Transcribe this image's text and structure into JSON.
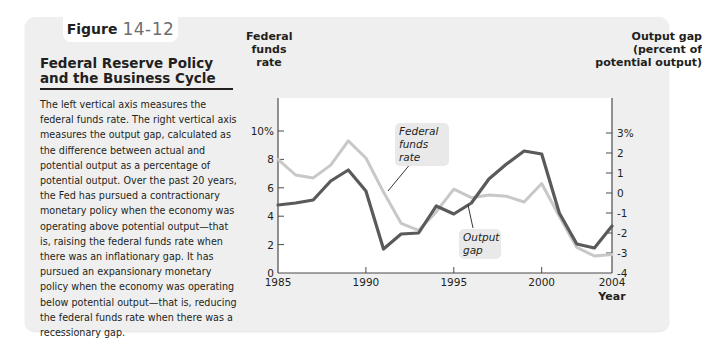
{
  "figure": {
    "label_word": "Figure",
    "label_number": "14-12"
  },
  "sidebar": {
    "title": "Federal Reserve Policy and the Business Cycle",
    "caption": "The left vertical axis measures the federal funds rate. The right vertical axis measures the output gap, calculated as the difference between actual and potential output as a percentage of potential output. Over the past 20 years, the Fed has pursued a contractionary monetary policy when the economy was operating above potential output—that is, raising the federal funds rate when there was an inflationary gap. It has pursued an expansionary monetary policy when the economy was operating below potential output—that is, reducing the federal funds rate when there was a recessionary gap."
  },
  "chart_data": {
    "type": "line",
    "title": "Federal Reserve Policy and the Business Cycle",
    "xlabel": "Year",
    "ylabel_left": "Federal funds rate",
    "ylabel_right": "Output gap (percent of potential output)",
    "x": [
      1985,
      1986,
      1987,
      1988,
      1989,
      1990,
      1991,
      1992,
      1993,
      1994,
      1995,
      1996,
      1997,
      1998,
      1999,
      2000,
      2001,
      2002,
      2003,
      2004
    ],
    "x_ticks": [
      "1985",
      "1990",
      "1995",
      "2000",
      "2004"
    ],
    "y_left_ticks": [
      "0",
      "2",
      "4",
      "6",
      "8",
      "10%"
    ],
    "y_right_ticks": [
      "-4",
      "-3",
      "-2",
      "-1",
      "0",
      "1",
      "2",
      "3%"
    ],
    "ylim_left": [
      0,
      12
    ],
    "ylim_right": [
      -4,
      4
    ],
    "grid": false,
    "series": [
      {
        "name": "Federal funds rate",
        "axis": "left",
        "color": "#c8c8c8",
        "values": [
          8.0,
          6.9,
          6.7,
          7.6,
          9.3,
          8.1,
          5.7,
          3.5,
          3.0,
          4.3,
          5.9,
          5.3,
          5.5,
          5.4,
          5.0,
          6.3,
          4.0,
          1.8,
          1.2,
          1.3
        ]
      },
      {
        "name": "Output gap",
        "axis": "right",
        "color": "#5a5a5c",
        "values": [
          -0.6,
          -0.5,
          -0.35,
          0.6,
          1.15,
          0.1,
          -2.8,
          -2.05,
          -2.0,
          -0.65,
          -1.05,
          -0.5,
          0.7,
          1.45,
          2.1,
          1.95,
          -1.0,
          -2.55,
          -2.75,
          -1.65
        ]
      }
    ],
    "annotations": [
      {
        "text": "Federal funds rate",
        "target": "Federal funds rate"
      },
      {
        "text": "Output gap",
        "target": "Output gap"
      }
    ]
  },
  "chart": {
    "left_axis_title": "Federal funds rate",
    "right_axis_title": "Output gap (percent of potential output)",
    "x_axis_title": "Year",
    "callout_ffr": "Federal funds rate",
    "callout_gap": "Output gap"
  }
}
